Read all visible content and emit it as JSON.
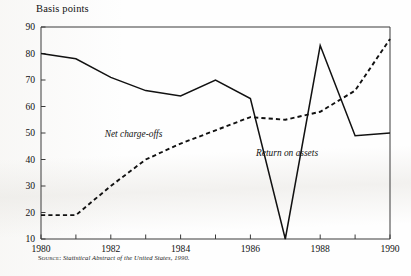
{
  "figure": {
    "axis_title": "Basis points",
    "source_lead": "Source:",
    "source_text": "Statistical Abstract of the United States, 1990."
  },
  "chart_data": {
    "type": "line",
    "title": "",
    "subtitle": "",
    "xlabel": "",
    "ylabel": "Basis points",
    "x": [
      1980,
      1981,
      1982,
      1983,
      1984,
      1985,
      1986,
      1987,
      1988,
      1989,
      1990
    ],
    "xlim": [
      1980,
      1990
    ],
    "ylim": [
      10,
      90
    ],
    "xticks": [
      1980,
      1981,
      1982,
      1983,
      1984,
      1985,
      1986,
      1987,
      1988,
      1989,
      1990
    ],
    "xtick_labels": [
      "1980",
      "",
      "1982",
      "",
      "1984",
      "",
      "1986",
      "",
      "1988",
      "",
      "1990"
    ],
    "yticks": [
      10,
      20,
      30,
      40,
      50,
      60,
      70,
      80,
      90
    ],
    "ytick_labels": [
      "10",
      "20",
      "30",
      "40",
      "50",
      "60",
      "70",
      "80",
      "90"
    ],
    "grid": false,
    "legend": "inline-annotations",
    "series": [
      {
        "name": "Return on assets",
        "style": "solid",
        "color": "#111111",
        "label_x": 1987.05,
        "label_y": 41.5,
        "values": [
          80,
          78,
          71,
          66,
          64,
          70,
          63,
          10,
          83,
          49,
          50
        ]
      },
      {
        "name": "Net charge-offs",
        "style": "dashed",
        "color": "#111111",
        "label_x": 1982.65,
        "label_y": 48.5,
        "values": [
          19,
          19,
          30,
          40,
          46,
          51,
          56,
          55,
          58,
          66,
          85.5
        ]
      }
    ]
  }
}
